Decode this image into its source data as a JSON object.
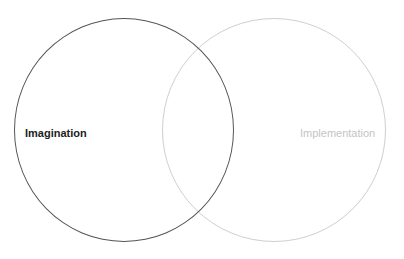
{
  "diagram": {
    "type": "venn",
    "sets": [
      {
        "label": "Imagination",
        "stroke_color": "#555555",
        "text_color": "#222222"
      },
      {
        "label": "Implementation",
        "stroke_color": "#cfcfcf",
        "text_color": "#c4c4c4"
      }
    ],
    "background": "#ffffff"
  }
}
